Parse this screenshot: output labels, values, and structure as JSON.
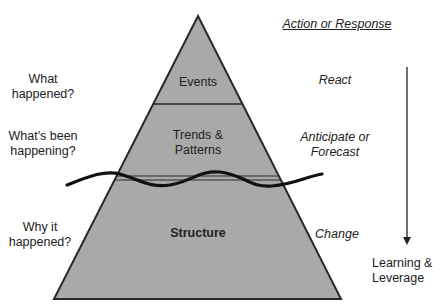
{
  "pyramid": {
    "fill_color": "#a9a9a9",
    "stroke_color": "#2a2a2a",
    "layers": [
      {
        "name": "Events",
        "question": "What\nhappened?",
        "response": "React"
      },
      {
        "name": "Trends &\nPatterns",
        "question": "What's been\nhappening?",
        "response": "Anticipate or\nForecast"
      },
      {
        "name": "Structure",
        "question": "Why it\nhappened?",
        "response": "Change"
      }
    ]
  },
  "response_header": "Action or Response",
  "arrow_label": "Learning &\nLeverage"
}
